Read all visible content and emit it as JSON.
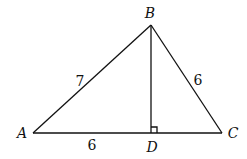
{
  "diagram": {
    "type": "triangle-with-altitude",
    "colors": {
      "stroke": "#111111",
      "background": "#ffffff"
    },
    "points": {
      "A": {
        "label": "A",
        "x": 33,
        "y": 133,
        "lx": 22,
        "ly": 138
      },
      "B": {
        "label": "B",
        "x": 151,
        "y": 25,
        "lx": 150,
        "ly": 18
      },
      "C": {
        "label": "C",
        "x": 222,
        "y": 133,
        "lx": 233,
        "ly": 138
      },
      "D": {
        "label": "D",
        "x": 151,
        "y": 133,
        "lx": 152,
        "ly": 152
      }
    },
    "segments": [
      {
        "from": "A",
        "to": "B",
        "length_label": "7"
      },
      {
        "from": "B",
        "to": "C",
        "length_label": "6"
      },
      {
        "from": "A",
        "to": "D",
        "length_label": "6"
      },
      {
        "from": "D",
        "to": "C",
        "length_label": ""
      },
      {
        "from": "B",
        "to": "D",
        "length_label": ""
      }
    ],
    "length_labels": {
      "AB": "7",
      "BC": "6",
      "AD": "6"
    },
    "right_angle_at": "D"
  }
}
